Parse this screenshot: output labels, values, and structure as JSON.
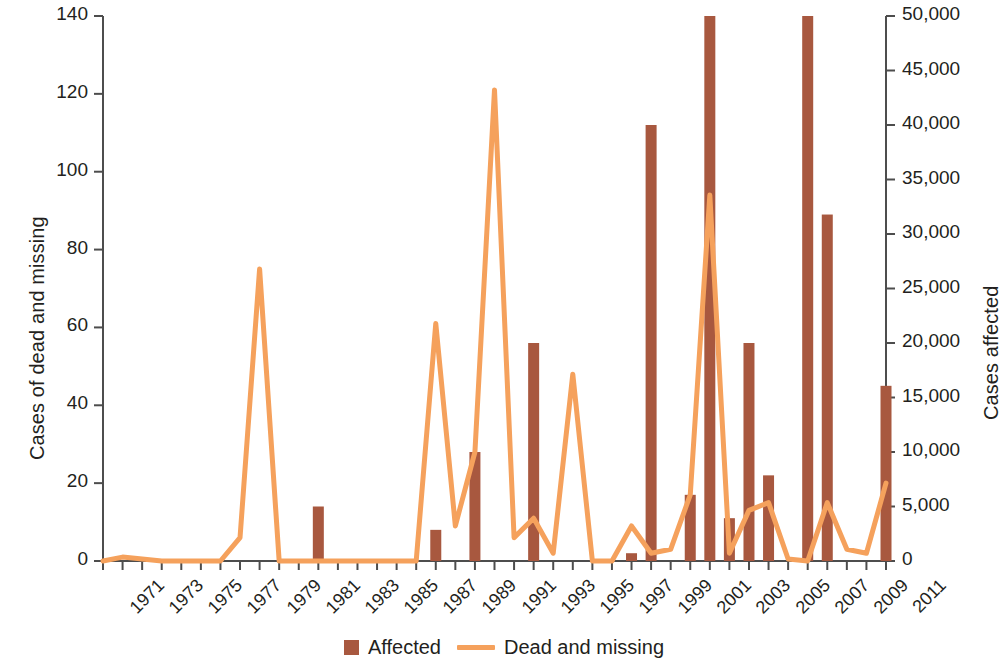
{
  "chart_data": {
    "type": "bar",
    "title": "",
    "subtitle": "",
    "xlabel": "",
    "ylabel": "Cases of dead and missing",
    "ylabel_right": "Cases affected",
    "grid": false,
    "legend_position": "bottom-center",
    "ylim": [
      0,
      140
    ],
    "yticks": [
      "0",
      "20",
      "40",
      "60",
      "80",
      "100",
      "120",
      "140"
    ],
    "ylim_right": [
      0,
      50000
    ],
    "yticks_right": [
      "0",
      "5,000",
      "10,000",
      "15,000",
      "20,000",
      "25,000",
      "30,000",
      "35,000",
      "40,000",
      "45,000",
      "50,000"
    ],
    "x": [
      1971,
      1972,
      1973,
      1974,
      1975,
      1976,
      1977,
      1978,
      1979,
      1980,
      1981,
      1982,
      1983,
      1984,
      1985,
      1986,
      1987,
      1988,
      1989,
      1990,
      1991,
      1992,
      1993,
      1994,
      1995,
      1996,
      1997,
      1998,
      1999,
      2000,
      2001,
      2002,
      2003,
      2004,
      2005,
      2006,
      2007,
      2008,
      2009,
      2010,
      2011
    ],
    "xtick_labels": [
      "1971",
      "1973",
      "1975",
      "1977",
      "1979",
      "1981",
      "1983",
      "1985",
      "1987",
      "1989",
      "1991",
      "1993",
      "1995",
      "1997",
      "1999",
      "2001",
      "2003",
      "2005",
      "2007",
      "2009",
      "2011"
    ],
    "series": [
      {
        "name": "Affected",
        "axis": "right",
        "type": "bar",
        "color": "#a8583f",
        "unit": "cases affected",
        "values": [
          0,
          0,
          0,
          0,
          0,
          0,
          0,
          0,
          0,
          0,
          0,
          5000,
          0,
          0,
          0,
          0,
          0,
          2850,
          0,
          10000,
          0,
          0,
          20000,
          0,
          0,
          0,
          0,
          700,
          40000,
          0,
          6000,
          50000,
          4000,
          20000,
          7850,
          0,
          50000,
          31800,
          0,
          0,
          16100
        ]
      },
      {
        "name": "Dead and missing",
        "axis": "left",
        "type": "line",
        "color": "#f5a15c",
        "unit": "cases of dead and missing",
        "values": [
          0,
          1,
          0.5,
          0,
          0,
          0,
          0,
          6,
          75,
          0,
          0,
          0,
          0,
          0,
          0,
          0,
          0,
          61,
          9,
          28,
          121,
          6,
          11,
          2,
          48,
          0,
          0,
          9,
          2,
          3,
          17,
          94,
          2,
          13,
          15,
          0.5,
          0,
          15,
          3,
          2,
          20
        ]
      }
    ],
    "bars_in_left_units": [
      0,
      0,
      0,
      0,
      0,
      0,
      0,
      0,
      0,
      0,
      0,
      14,
      0,
      0,
      0,
      0,
      0,
      8,
      0,
      28,
      0,
      0,
      56,
      0,
      0,
      0,
      0,
      2,
      112,
      0,
      17,
      140,
      11,
      56,
      22,
      0,
      140,
      89,
      0,
      0,
      45
    ]
  },
  "legend": {
    "items": [
      {
        "label": "Affected",
        "marker": "bar-swatch",
        "color": "#a8583f"
      },
      {
        "label": "Dead and missing",
        "marker": "line-swatch",
        "color": "#f5a15c"
      }
    ]
  },
  "axes": {
    "left_title": "Cases of dead and missing",
    "right_title": "Cases affected"
  }
}
